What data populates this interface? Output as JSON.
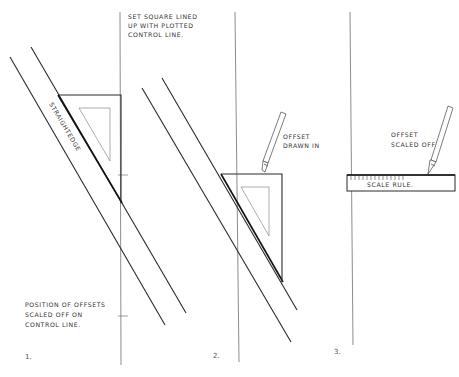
{
  "diagram": {
    "panels": [
      {
        "number": "1.",
        "straightedge_label": "STRAIGHTEDGE",
        "note": [
          "POSITION OF OFFSETS",
          "SCALED OFF ON",
          "CONTROL LINE."
        ]
      },
      {
        "number": "2.",
        "top_note": [
          "SET SQUARE LINED",
          "UP WITH PLOTTED",
          "CONTROL LINE."
        ],
        "note": [
          "OFFSET",
          "DRAWN IN"
        ]
      },
      {
        "number": "3.",
        "note": [
          "OFFSET",
          "SCALED OFF"
        ],
        "scale_label": "SCALE RULE."
      }
    ],
    "colors": {
      "background": "#ffffff",
      "ink": "#2a2a2a",
      "control_line": "#6e6e6e"
    }
  }
}
